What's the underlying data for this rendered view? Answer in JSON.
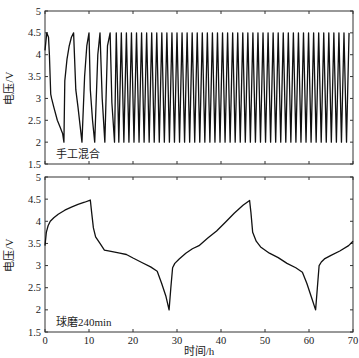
{
  "chart_data": [
    {
      "type": "line",
      "panel": "top",
      "annotation": "手工混合",
      "xlabel": "",
      "ylabel": "电压/V",
      "xlim": [
        0,
        70
      ],
      "ylim": [
        1.5,
        5
      ],
      "xticks": [
        0,
        10,
        20,
        30,
        40,
        50,
        60,
        70
      ],
      "yticks": [
        1.5,
        2,
        2.5,
        3,
        3.5,
        4,
        4.5,
        5
      ],
      "ytick_labels": [
        "1.5",
        "2",
        "2.5",
        "3",
        "3.5",
        "4",
        "4.5",
        "5"
      ],
      "grid": false,
      "series": [
        {
          "name": "手工混合",
          "color": "#111111",
          "description": "Charge/discharge cycling between 2.0 V and 4.5 V; first cycles are long, then rapid periodic cycling (~1.15 h per cycle) until 70 h",
          "x": [
            0,
            0.4,
            0.8,
            1.0,
            1.3,
            1.5,
            2.0,
            2.8,
            3.4,
            4.0,
            4.3,
            4.5,
            5.0,
            5.5,
            6.0,
            6.5,
            7.0,
            7.5,
            8.4,
            9.0,
            9.5,
            10.0,
            10.3,
            10.8,
            11.3,
            12.0,
            12.5,
            13.0,
            13.6,
            14.2,
            14.8,
            15.2,
            15.8,
            16.2
          ],
          "y": [
            4.1,
            4.5,
            4.4,
            4.0,
            3.1,
            3.0,
            2.8,
            2.5,
            2.35,
            2.2,
            2.0,
            3.4,
            3.9,
            4.2,
            4.4,
            4.5,
            3.2,
            2.8,
            2.0,
            3.5,
            4.2,
            4.5,
            3.2,
            2.5,
            2.0,
            4.0,
            4.5,
            3.0,
            2.0,
            4.2,
            4.5,
            2.9,
            2.0,
            4.5
          ],
          "periodic_after": {
            "start_h": 16.2,
            "end_h": 70,
            "period_h": 1.15,
            "v_max": 4.5,
            "v_min": 2.0
          }
        }
      ]
    },
    {
      "type": "line",
      "panel": "bottom",
      "annotation": "球磨240min",
      "xlabel": "时间/h",
      "ylabel": "电压/V",
      "xlim": [
        0,
        70
      ],
      "ylim": [
        1.5,
        5
      ],
      "xticks": [
        0,
        10,
        20,
        30,
        40,
        50,
        60,
        70
      ],
      "xtick_labels": [
        "0",
        "10",
        "20",
        "30",
        "40",
        "50",
        "60",
        "70"
      ],
      "yticks": [
        1.5,
        2,
        2.5,
        3,
        3.5,
        4,
        4.5,
        5
      ],
      "ytick_labels": [
        "1.5",
        "2",
        "2.5",
        "3",
        "3.5",
        "4",
        "4.5",
        "5"
      ],
      "grid": false,
      "series": [
        {
          "name": "球磨240min",
          "color": "#111111",
          "x": [
            0,
            0.3,
            0.7,
            1.2,
            2.0,
            3.0,
            4.5,
            6.0,
            7.5,
            9.0,
            10.3,
            10.6,
            11.0,
            11.5,
            12.5,
            13.5,
            15.0,
            17.0,
            18.5,
            20.0,
            22.0,
            24.0,
            25.5,
            26.5,
            27.5,
            28.2,
            28.6,
            29.0,
            29.5,
            30.5,
            32.0,
            33.5,
            35.0,
            37.0,
            39.0,
            41.0,
            43.0,
            45.0,
            46.5,
            46.8,
            47.2,
            48.0,
            49.0,
            51.0,
            53.0,
            55.0,
            57.0,
            58.5,
            59.5,
            60.5,
            61.5,
            61.9,
            62.3,
            62.8,
            63.5,
            65.0,
            67.0,
            69.0,
            70.0
          ],
          "y": [
            3.45,
            3.75,
            3.9,
            4.0,
            4.08,
            4.16,
            4.25,
            4.32,
            4.38,
            4.43,
            4.48,
            4.2,
            3.85,
            3.65,
            3.5,
            3.35,
            3.32,
            3.28,
            3.25,
            3.17,
            3.07,
            2.97,
            2.87,
            2.6,
            2.3,
            2.0,
            2.5,
            2.95,
            3.05,
            3.15,
            3.28,
            3.38,
            3.45,
            3.62,
            3.78,
            3.98,
            4.18,
            4.36,
            4.47,
            4.2,
            3.75,
            3.55,
            3.42,
            3.28,
            3.18,
            3.05,
            2.95,
            2.85,
            2.6,
            2.3,
            2.0,
            2.5,
            3.0,
            3.08,
            3.15,
            3.23,
            3.33,
            3.45,
            3.55
          ]
        }
      ]
    }
  ],
  "panels": {
    "top": {
      "ylabel": "电压/V",
      "annotation": "手工混合"
    },
    "bottom": {
      "ylabel": "电压/V",
      "annotation": "球磨240min",
      "xlabel": "时间/h"
    }
  }
}
